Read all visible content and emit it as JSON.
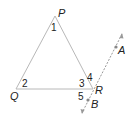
{
  "diagram": {
    "type": "geometry",
    "colors": {
      "triangle_stroke": "#b8b8b8",
      "dashed_line": "#999999",
      "point": "#888888",
      "label": "#222222"
    },
    "vertices": {
      "P": {
        "label": "P",
        "x": 55,
        "y": 16
      },
      "Q": {
        "label": "Q",
        "x": 16,
        "y": 89
      },
      "R": {
        "label": "R",
        "x": 93,
        "y": 89
      }
    },
    "line_points": {
      "A": {
        "label": "A",
        "x": 116,
        "y": 47
      },
      "B": {
        "label": "B",
        "x": 88,
        "y": 100
      }
    },
    "angles": [
      {
        "id": "1",
        "label": "1",
        "at": "P"
      },
      {
        "id": "2",
        "label": "2",
        "at": "Q"
      },
      {
        "id": "3",
        "label": "3",
        "at": "R",
        "between": "RQ-RP"
      },
      {
        "id": "4",
        "label": "4",
        "at": "R",
        "between": "RP-RA"
      },
      {
        "id": "5",
        "label": "5",
        "at": "R",
        "between": "RQ-RB"
      }
    ]
  }
}
